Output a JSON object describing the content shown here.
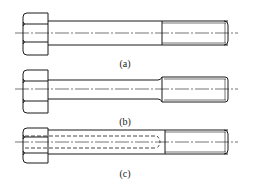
{
  "figure": {
    "subfigures": [
      {
        "id": "a",
        "label": "(a)",
        "description": "Hex head bolt, full shank with threaded end"
      },
      {
        "id": "b",
        "label": "(b)",
        "description": "Hex head bolt, reduced shank diameter with threaded end"
      },
      {
        "id": "c",
        "label": "(c)",
        "description": "Hex head bolt with internal axial hole (hidden lines) and threaded end"
      }
    ],
    "colors": {
      "line": "#1a1a1a",
      "background": "#ffffff"
    }
  }
}
